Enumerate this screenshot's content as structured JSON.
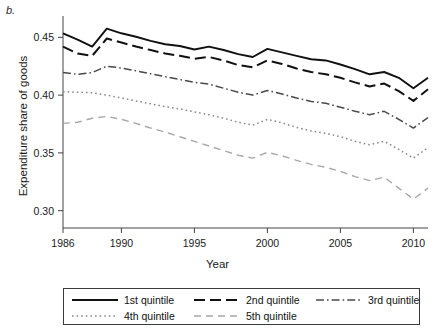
{
  "panel_label": "b.",
  "axes": {
    "ylabel": "Expenditure share of goods",
    "xlabel": "Year",
    "ytick_labels": [
      "0.30",
      "0.35",
      "0.40",
      "0.45"
    ],
    "xtick_labels": [
      "1986",
      "1990",
      "1995",
      "2000",
      "2005",
      "2010"
    ]
  },
  "legend": {
    "entries": [
      {
        "label": "1st quintile",
        "style": "solid",
        "color": "#111111"
      },
      {
        "label": "2nd quintile",
        "style": "long-dash",
        "color": "#111111"
      },
      {
        "label": "3rd quintile",
        "style": "dash-dot",
        "color": "#4a4a4a"
      },
      {
        "label": "4th quintile",
        "style": "dotted",
        "color": "#8a8a8a"
      },
      {
        "label": "5th quintile",
        "style": "loose-dash",
        "color": "#a8a8a8"
      }
    ]
  },
  "chart_data": {
    "type": "line",
    "title": "",
    "subtitle": "",
    "xlabel": "Year",
    "ylabel": "Expenditure share of goods",
    "xlim": [
      1986,
      2011
    ],
    "ylim": [
      0.285,
      0.465
    ],
    "yticks": [
      0.3,
      0.35,
      0.4,
      0.45
    ],
    "xticks": [
      1986,
      1990,
      1995,
      2000,
      2005,
      2010
    ],
    "grid": false,
    "legend_position": "below-plot",
    "x": [
      1986,
      1987,
      1988,
      1989,
      1990,
      1991,
      1992,
      1993,
      1994,
      1995,
      1996,
      1997,
      1998,
      1999,
      2000,
      2001,
      2002,
      2003,
      2004,
      2005,
      2006,
      2007,
      2008,
      2009,
      2010,
      2011
    ],
    "series": [
      {
        "name": "1st quintile",
        "style": "solid",
        "color": "#111111",
        "values": [
          0.4535,
          0.448,
          0.442,
          0.4575,
          0.4535,
          0.4505,
          0.447,
          0.444,
          0.4425,
          0.4395,
          0.442,
          0.439,
          0.4355,
          0.433,
          0.44,
          0.437,
          0.434,
          0.431,
          0.43,
          0.4265,
          0.4225,
          0.418,
          0.42,
          0.415,
          0.406,
          0.415
        ]
      },
      {
        "name": "2nd quintile",
        "style": "long-dash",
        "color": "#111111",
        "values": [
          0.442,
          0.436,
          0.434,
          0.449,
          0.4455,
          0.442,
          0.439,
          0.436,
          0.434,
          0.4315,
          0.433,
          0.43,
          0.426,
          0.424,
          0.43,
          0.427,
          0.423,
          0.42,
          0.418,
          0.415,
          0.411,
          0.4075,
          0.41,
          0.4035,
          0.395,
          0.405
        ]
      },
      {
        "name": "3rd quintile",
        "style": "dash-dot",
        "color": "#4a4a4a",
        "values": [
          0.4195,
          0.418,
          0.4195,
          0.425,
          0.4235,
          0.421,
          0.4185,
          0.416,
          0.4135,
          0.411,
          0.4095,
          0.406,
          0.4025,
          0.4,
          0.404,
          0.401,
          0.3975,
          0.3945,
          0.393,
          0.3895,
          0.386,
          0.383,
          0.386,
          0.379,
          0.3715,
          0.3805
        ]
      },
      {
        "name": "4th quintile",
        "style": "dotted",
        "color": "#8a8a8a",
        "values": [
          0.403,
          0.4025,
          0.402,
          0.4,
          0.3975,
          0.395,
          0.3925,
          0.39,
          0.388,
          0.3855,
          0.383,
          0.38,
          0.3765,
          0.374,
          0.379,
          0.376,
          0.372,
          0.369,
          0.367,
          0.364,
          0.36,
          0.357,
          0.36,
          0.353,
          0.3455,
          0.3545
        ]
      },
      {
        "name": "5th quintile",
        "style": "loose-dash",
        "color": "#a8a8a8",
        "values": [
          0.3755,
          0.3765,
          0.38,
          0.3815,
          0.379,
          0.3755,
          0.3715,
          0.368,
          0.364,
          0.36,
          0.356,
          0.352,
          0.348,
          0.3455,
          0.3505,
          0.3475,
          0.3435,
          0.34,
          0.3375,
          0.334,
          0.3295,
          0.326,
          0.329,
          0.3195,
          0.31,
          0.3195
        ]
      }
    ]
  }
}
